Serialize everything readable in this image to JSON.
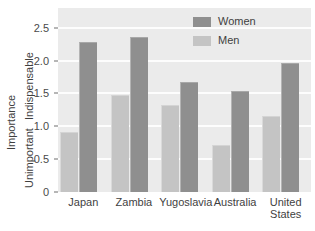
{
  "chart_data": {
    "type": "bar",
    "title": "",
    "subtitle": "",
    "xlabel": "",
    "ylabel": "Importance",
    "categories": [
      "Japan",
      "Zambia",
      "Yugoslavia",
      "Australia",
      "United States"
    ],
    "category_lines": [
      [
        "Japan"
      ],
      [
        "Zambia"
      ],
      [
        "Yugoslavia"
      ],
      [
        "Australia"
      ],
      [
        "United",
        "States"
      ]
    ],
    "series": [
      {
        "name": "Men",
        "color": "#c4c4c4",
        "values": [
          0.9,
          1.46,
          1.31,
          0.7,
          1.14
        ]
      },
      {
        "name": "Women",
        "color": "#8f8f8f",
        "values": [
          2.27,
          2.34,
          1.66,
          1.52,
          1.95
        ]
      }
    ],
    "ylim": [
      0,
      2.8
    ],
    "yticks": [
      0,
      0.5,
      1.0,
      1.5,
      2.0,
      2.5
    ],
    "ytick_labels": [
      "0",
      "0.5",
      "1.0",
      "1.5",
      "2.0",
      "2.5"
    ],
    "y_axis_low_label": "Unimportant",
    "y_axis_high_label": "Indispensable",
    "grid": "horizontal",
    "legend_position": "top-right",
    "plot_background": "#ebebeb",
    "gridline_color": "#fdfdfd"
  },
  "legend": {
    "entries": [
      {
        "label": "Women",
        "color": "#8f8f8f"
      },
      {
        "label": "Men",
        "color": "#c4c4c4"
      }
    ]
  },
  "axis": {
    "y_title": "Importance",
    "y_low": "Unimportant",
    "y_high": "Indispensable"
  }
}
